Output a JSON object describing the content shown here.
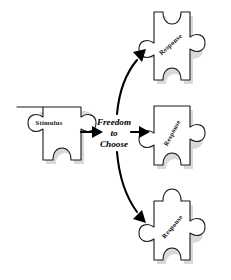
{
  "diagram": {
    "background_color": "#ffffff",
    "stroke_color": "#1a1a1a",
    "shadow_color": "#b9b9b9",
    "arrow_color": "#000000",
    "stimulus": {
      "label": "Stimulus"
    },
    "center": {
      "line1": "Freedom",
      "line2": "to",
      "line3": "Choose"
    },
    "responses": [
      {
        "label": "Response",
        "position": "top"
      },
      {
        "label": "Response",
        "position": "middle"
      },
      {
        "label": "Response",
        "position": "bottom"
      }
    ]
  }
}
